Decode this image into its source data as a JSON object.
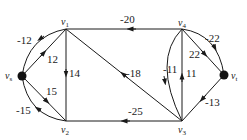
{
  "diagram": {
    "type": "directed-graph",
    "nodes": [
      {
        "id": "vs",
        "label": "v",
        "sub": "s",
        "x": 22,
        "y": 76,
        "filled": true
      },
      {
        "id": "v1",
        "label": "v",
        "sub": "1",
        "x": 66,
        "y": 29,
        "filled": false
      },
      {
        "id": "v2",
        "label": "v",
        "sub": "2",
        "x": 66,
        "y": 121,
        "filled": false
      },
      {
        "id": "v3",
        "label": "v",
        "sub": "3",
        "x": 182,
        "y": 121,
        "filled": false
      },
      {
        "id": "v4",
        "label": "v",
        "sub": "4",
        "x": 182,
        "y": 29,
        "filled": false
      },
      {
        "id": "vt",
        "label": "v",
        "sub": "t",
        "x": 224,
        "y": 75,
        "filled": true
      }
    ],
    "edges": [
      {
        "from": "vs",
        "to": "v1",
        "weight": "12",
        "curved": false
      },
      {
        "from": "v1",
        "to": "vs",
        "weight": "-12",
        "curved": true
      },
      {
        "from": "vs",
        "to": "v2",
        "weight": "15",
        "curved": false
      },
      {
        "from": "v2",
        "to": "vs",
        "weight": "-15",
        "curved": true
      },
      {
        "from": "v1",
        "to": "v2",
        "weight": "14",
        "curved": false
      },
      {
        "from": "v4",
        "to": "v1",
        "weight": "-20",
        "curved": false
      },
      {
        "from": "v3",
        "to": "v1",
        "weight": "-18",
        "curved": false
      },
      {
        "from": "v4",
        "to": "v3",
        "weight": "-11",
        "curved": true
      },
      {
        "from": "v3",
        "to": "v4",
        "weight": "11",
        "curved": false
      },
      {
        "from": "v3",
        "to": "v2",
        "weight": "-25",
        "curved": false
      },
      {
        "from": "v4",
        "to": "vt",
        "weight": "22",
        "curved": false
      },
      {
        "from": "vt",
        "to": "v4",
        "weight": "-22",
        "curved": true
      },
      {
        "from": "vt",
        "to": "v3",
        "weight": "-13",
        "curved": false
      }
    ],
    "labels": {
      "vs": "v",
      "vs_sub": "s",
      "v1": "v",
      "v1_sub": "1",
      "v2": "v",
      "v2_sub": "2",
      "v3": "v",
      "v3_sub": "3",
      "v4": "v",
      "v4_sub": "4",
      "vt": "v",
      "vt_sub": "t",
      "w_vs_v1": "12",
      "w_v1_vs": "-12",
      "w_vs_v2": "15",
      "w_v2_vs": "-15",
      "w_v1_v2": "14",
      "w_v4_v1": "-20",
      "w_v3_v1": "-18",
      "w_v4_v3": "-11",
      "w_v3_v4": "11",
      "w_v3_v2": "-25",
      "w_v4_vt": "22",
      "w_vt_v4": "-22",
      "w_vt_v3": "-13"
    }
  }
}
